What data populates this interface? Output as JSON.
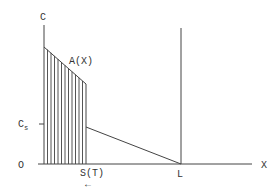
{
  "diagram": {
    "axes": {
      "y_label": "C",
      "x_label": "X",
      "origin_label": "O",
      "cs_label_main": "C",
      "cs_label_sub": "s"
    },
    "curve_label": "A(X)",
    "front_label": "S(T)",
    "front_arrow": "←",
    "boundary_label": "L",
    "colors": {
      "line": "#444444",
      "text": "#333333",
      "background": "#ffffff"
    },
    "geometry": {
      "origin": [
        44,
        164
      ],
      "y_axis_top": [
        44,
        25
      ],
      "x_axis_end": [
        252,
        164
      ],
      "boundary_x": 181,
      "boundary_top_y": 28,
      "hatch_left_x": 44,
      "hatch_right_x": 86,
      "hatch_top_left_y": 47,
      "hatch_top_right_y": 84,
      "cs_level_y": 124,
      "linear_start": [
        86,
        127
      ],
      "linear_end": [
        181,
        164
      ],
      "hatch_line_count": 12
    }
  }
}
